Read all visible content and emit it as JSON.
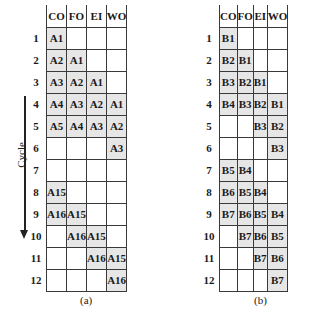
{
  "columns": [
    "CO",
    "FO",
    "EI",
    "WO"
  ],
  "rows": [
    "1",
    "2",
    "3",
    "4",
    "5",
    "6",
    "7",
    "8",
    "9",
    "10",
    "11",
    "12"
  ],
  "axis_label": "Cycle",
  "panels": [
    {
      "caption": "(a)",
      "cells": [
        [
          "A1",
          "",
          "",
          ""
        ],
        [
          "A2",
          "A1",
          "",
          ""
        ],
        [
          "A3",
          "A2",
          "A1",
          ""
        ],
        [
          "A4",
          "A3",
          "A2",
          "A1"
        ],
        [
          "A5",
          "A4",
          "A3",
          "A2"
        ],
        [
          "",
          "",
          "",
          "A3"
        ],
        [
          "",
          "",
          "",
          ""
        ],
        [
          "A15",
          "",
          "",
          ""
        ],
        [
          "A16",
          "A15",
          "",
          ""
        ],
        [
          "",
          "A16",
          "A15",
          ""
        ],
        [
          "",
          "",
          "A16",
          "A15"
        ],
        [
          "",
          "",
          "",
          "A16"
        ]
      ]
    },
    {
      "caption": "(b)",
      "cells": [
        [
          "B1",
          "",
          "",
          ""
        ],
        [
          "B2",
          "B1",
          "",
          ""
        ],
        [
          "B3",
          "B2",
          "B1",
          ""
        ],
        [
          "B4",
          "B3",
          "B2",
          "B1"
        ],
        [
          "",
          "",
          "B3",
          "B2"
        ],
        [
          "",
          "",
          "",
          "B3"
        ],
        [
          "B5",
          "B4",
          "",
          ""
        ],
        [
          "B6",
          "B5",
          "B4",
          ""
        ],
        [
          "B7",
          "B6",
          "B5",
          "B4"
        ],
        [
          "",
          "B7",
          "B6",
          "B5"
        ],
        [
          "",
          "",
          "B7",
          "B6"
        ],
        [
          "",
          "",
          "",
          "B7"
        ]
      ]
    }
  ],
  "colors": {
    "filled_cell": "#e6e6e6",
    "grid_line": "#3a3a3a"
  }
}
